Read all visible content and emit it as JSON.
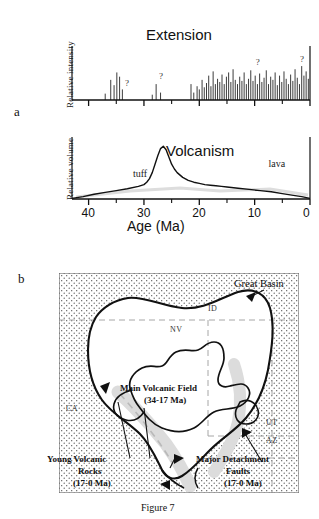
{
  "figure": {
    "caption": "Figure 7",
    "panel_a_letter": "a",
    "panel_b_letter": "b"
  },
  "chart_data": [
    {
      "type": "bar",
      "id": "extension",
      "title": "Extension",
      "xlabel": "Age (Ma)",
      "ylabel": "Relative  intensity",
      "xlim": [
        43,
        0
      ],
      "ylim": [
        0,
        100
      ],
      "grid": false,
      "legend": "none",
      "x_tick_labels": [],
      "x_major_ticks": [
        40,
        30,
        20,
        10,
        0
      ],
      "x_minor_ticks": [
        35,
        25,
        15,
        5
      ],
      "annotations": [
        {
          "text": "?",
          "x": 33.4,
          "y": 22
        },
        {
          "text": "?",
          "x": 27.3,
          "y": 36
        },
        {
          "text": "?",
          "x": 9.8,
          "y": 62
        },
        {
          "text": "?",
          "x": 1.8,
          "y": 68
        }
      ],
      "x": [
        37.0,
        36.0,
        35.4,
        34.9,
        34.4,
        33.9,
        28.5,
        27.8,
        27.0,
        21.5,
        21.0,
        20.4,
        20.0,
        19.5,
        19.1,
        18.7,
        18.3,
        17.9,
        17.5,
        17.1,
        16.7,
        16.3,
        15.9,
        15.5,
        15.1,
        14.7,
        14.3,
        13.9,
        13.5,
        13.1,
        12.7,
        12.3,
        11.9,
        11.5,
        11.1,
        10.7,
        10.3,
        9.9,
        9.5,
        9.1,
        8.7,
        8.3,
        7.9,
        7.5,
        7.1,
        6.7,
        6.3,
        5.9,
        5.5,
        5.1,
        4.7,
        4.3,
        3.9,
        3.5,
        3.1,
        2.7,
        2.3,
        1.9,
        1.5,
        1.1,
        0.7,
        0.3
      ],
      "values": [
        12,
        38,
        28,
        52,
        44,
        20,
        10,
        30,
        14,
        30,
        14,
        26,
        20,
        38,
        24,
        32,
        46,
        26,
        54,
        30,
        40,
        34,
        48,
        30,
        44,
        52,
        34,
        58,
        38,
        30,
        44,
        36,
        52,
        30,
        40,
        56,
        36,
        46,
        30,
        50,
        34,
        42,
        56,
        30,
        44,
        38,
        52,
        28,
        46,
        34,
        54,
        40,
        30,
        48,
        36,
        58,
        42,
        30,
        64,
        46,
        54,
        40
      ]
    },
    {
      "type": "line",
      "id": "volcanism",
      "title": "Volcanism",
      "xlabel": "Age (Ma)",
      "ylabel": "Relative volume",
      "xlim": [
        43,
        0
      ],
      "ylim": [
        0,
        100
      ],
      "grid": false,
      "legend": "none",
      "x_tick_labels": [
        "40",
        "30",
        "20",
        "10",
        "0"
      ],
      "x_major_ticks": [
        40,
        30,
        20,
        10,
        0
      ],
      "x_minor_ticks": [
        35,
        25,
        15,
        5
      ],
      "annotations": [
        {
          "text": "tuff",
          "x": 32.0,
          "y": 34
        },
        {
          "text": "lava",
          "x": 7.5,
          "y": 50
        }
      ],
      "x": [
        43.0,
        41.0,
        39.0,
        37.0,
        35.0,
        33.0,
        31.0,
        30.0,
        29.5,
        29.0,
        28.5,
        28.0,
        27.5,
        27.0,
        26.5,
        26.0,
        25.5,
        25.0,
        24.5,
        24.0,
        23.0,
        22.0,
        21.0,
        20.0,
        19.0,
        18.0,
        17.0,
        16.0,
        15.0,
        13.0,
        11.0,
        9.0,
        7.0,
        5.0,
        3.0,
        1.5,
        0.0
      ],
      "values": [
        1,
        4,
        8,
        11,
        14,
        17,
        21,
        24,
        28,
        34,
        44,
        58,
        72,
        84,
        88,
        82,
        70,
        58,
        50,
        44,
        36,
        31,
        28,
        26,
        24,
        23,
        22,
        21,
        20,
        18,
        16,
        14,
        12,
        9,
        6,
        4,
        1
      ]
    }
  ],
  "map": {
    "title_labels": {
      "great_basin": "Great Basin",
      "main_volcanic_field_line1": "Main Volcanic Field",
      "main_volcanic_field_line2": "(34-17 Ma)",
      "young_volcanic_line1": "Young Volcanic",
      "young_volcanic_line2": "Rocks",
      "young_volcanic_line3": "(17-0 Ma)",
      "detachment_line1": "Major Detachment",
      "detachment_line2": "Faults",
      "detachment_line3": "(17-0 Ma)"
    },
    "states": [
      {
        "abbr": "ID"
      },
      {
        "abbr": "NV"
      },
      {
        "abbr": "CA"
      },
      {
        "abbr": "UT"
      },
      {
        "abbr": "AZ"
      }
    ],
    "colors": {
      "stipple": "#4a4a4a",
      "outline": "#111111",
      "state_border": "#9a9a9a",
      "young_volcanic_band": "#d8d8d8"
    }
  }
}
